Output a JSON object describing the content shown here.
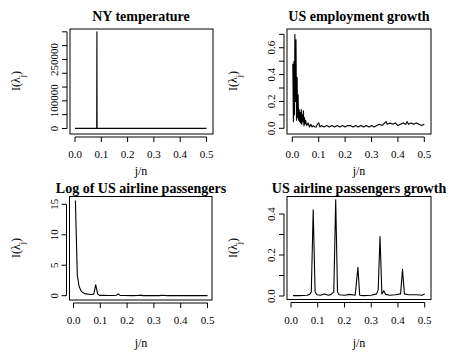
{
  "chart_data": [
    {
      "type": "line",
      "title": "NY temperature",
      "xlabel": "j/n",
      "ylabel": "I(λj)",
      "xlim": [
        0,
        0.5
      ],
      "ylim": [
        0,
        350000
      ],
      "xticks": [
        0.0,
        0.1,
        0.2,
        0.3,
        0.4,
        0.5
      ],
      "xtick_labels": [
        "0.0",
        "0.1",
        "0.2",
        "0.3",
        "0.4",
        "0.5"
      ],
      "yticks": [
        0,
        50000,
        100000,
        150000,
        200000,
        250000,
        300000,
        350000
      ],
      "ytick_labels": [
        "0",
        "",
        "100000",
        "",
        "",
        "250000",
        "",
        ""
      ],
      "grid": false,
      "series": [
        {
          "name": "periodogram",
          "x": [
            0.0,
            0.08,
            0.0825,
            0.0833,
            0.0842,
            0.086,
            0.5
          ],
          "y": [
            300,
            300,
            300,
            350000,
            300,
            300,
            300
          ]
        }
      ]
    },
    {
      "type": "line",
      "title": "US employment growth",
      "xlabel": "j/n",
      "ylabel": "I(λj)",
      "xlim": [
        0,
        0.5
      ],
      "ylim": [
        0,
        0.7
      ],
      "xticks": [
        0.0,
        0.1,
        0.2,
        0.3,
        0.4,
        0.5
      ],
      "xtick_labels": [
        "0.0",
        "0.1",
        "0.2",
        "0.3",
        "0.4",
        "0.5"
      ],
      "yticks": [
        0.0,
        0.1,
        0.2,
        0.3,
        0.4,
        0.5,
        0.6,
        0.7
      ],
      "ytick_labels": [
        "0.0",
        "",
        "0.2",
        "",
        "0.4",
        "",
        "0.6",
        ""
      ],
      "grid": false,
      "series": [
        {
          "name": "periodogram",
          "x": [
            0.002,
            0.004,
            0.006,
            0.008,
            0.01,
            0.012,
            0.014,
            0.016,
            0.018,
            0.02,
            0.022,
            0.024,
            0.026,
            0.028,
            0.03,
            0.032,
            0.034,
            0.036,
            0.038,
            0.04,
            0.042,
            0.044,
            0.046,
            0.048,
            0.05,
            0.055,
            0.06,
            0.065,
            0.07,
            0.075,
            0.08,
            0.085,
            0.09,
            0.095,
            0.1,
            0.105,
            0.11,
            0.12,
            0.13,
            0.14,
            0.15,
            0.16,
            0.17,
            0.18,
            0.19,
            0.2,
            0.21,
            0.22,
            0.23,
            0.24,
            0.25,
            0.26,
            0.27,
            0.28,
            0.29,
            0.3,
            0.31,
            0.32,
            0.33,
            0.34,
            0.35,
            0.355,
            0.36,
            0.37,
            0.38,
            0.39,
            0.4,
            0.41,
            0.42,
            0.43,
            0.435,
            0.44,
            0.45,
            0.46,
            0.47,
            0.48,
            0.49,
            0.5
          ],
          "y": [
            0.48,
            0.05,
            0.5,
            0.1,
            0.7,
            0.2,
            0.66,
            0.06,
            0.38,
            0.08,
            0.25,
            0.06,
            0.14,
            0.05,
            0.12,
            0.04,
            0.14,
            0.03,
            0.1,
            0.05,
            0.13,
            0.02,
            0.08,
            0.03,
            0.06,
            0.02,
            0.04,
            0.01,
            0.03,
            0.01,
            0.02,
            0.01,
            0.01,
            0.03,
            0.04,
            0.01,
            0.02,
            0.01,
            0.02,
            0.01,
            0.02,
            0.01,
            0.02,
            0.01,
            0.02,
            0.01,
            0.02,
            0.02,
            0.01,
            0.02,
            0.01,
            0.02,
            0.01,
            0.02,
            0.01,
            0.02,
            0.01,
            0.02,
            0.03,
            0.02,
            0.04,
            0.05,
            0.03,
            0.04,
            0.03,
            0.04,
            0.02,
            0.03,
            0.04,
            0.03,
            0.05,
            0.03,
            0.04,
            0.03,
            0.04,
            0.03,
            0.02,
            0.03
          ]
        }
      ]
    },
    {
      "type": "line",
      "title": "Log of US airline passengers",
      "xlabel": "j/n",
      "ylabel": "I(λj)",
      "xlim": [
        0,
        0.5
      ],
      "ylim": [
        0,
        15
      ],
      "xticks": [
        0.0,
        0.1,
        0.2,
        0.3,
        0.4,
        0.5
      ],
      "xtick_labels": [
        "0.0",
        "0.1",
        "0.2",
        "0.3",
        "0.4",
        "0.5"
      ],
      "yticks": [
        0,
        5,
        10,
        15
      ],
      "ytick_labels": [
        "0",
        "5",
        "10",
        "15"
      ],
      "grid": false,
      "series": [
        {
          "name": "periodogram",
          "x": [
            0.007,
            0.014,
            0.021,
            0.028,
            0.035,
            0.042,
            0.049,
            0.056,
            0.063,
            0.069,
            0.076,
            0.083,
            0.09,
            0.097,
            0.11,
            0.13,
            0.15,
            0.16,
            0.167,
            0.174,
            0.19,
            0.22,
            0.24,
            0.25,
            0.26,
            0.29,
            0.32,
            0.333,
            0.35,
            0.38,
            0.417,
            0.44,
            0.47,
            0.5
          ],
          "y": [
            15.6,
            3.4,
            1.5,
            0.8,
            0.5,
            0.35,
            0.3,
            0.25,
            0.2,
            0.2,
            0.3,
            1.8,
            0.3,
            0.05,
            0.05,
            0.03,
            0.04,
            0.08,
            0.3,
            0.05,
            0.03,
            0.02,
            0.03,
            0.1,
            0.02,
            0.02,
            0.02,
            0.06,
            0.02,
            0.02,
            0.04,
            0.02,
            0.02,
            0.02
          ]
        }
      ]
    },
    {
      "type": "line",
      "title": "US airline passengers growth",
      "xlabel": "j/n",
      "ylabel": "I(λj)",
      "xlim": [
        0,
        0.5
      ],
      "ylim": [
        0,
        0.47
      ],
      "xticks": [
        0.0,
        0.1,
        0.2,
        0.3,
        0.4,
        0.5
      ],
      "xtick_labels": [
        "0.0",
        "0.1",
        "0.2",
        "0.3",
        "0.4",
        "0.5"
      ],
      "yticks": [
        0.0,
        0.1,
        0.2,
        0.3,
        0.4
      ],
      "ytick_labels": [
        "0.0",
        "",
        "0.2",
        "",
        "0.4"
      ],
      "grid": false,
      "series": [
        {
          "name": "periodogram",
          "x": [
            0.007,
            0.03,
            0.06,
            0.07,
            0.076,
            0.083,
            0.09,
            0.097,
            0.11,
            0.125,
            0.14,
            0.15,
            0.16,
            0.167,
            0.174,
            0.18,
            0.2,
            0.22,
            0.24,
            0.25,
            0.257,
            0.27,
            0.3,
            0.32,
            0.326,
            0.333,
            0.34,
            0.347,
            0.354,
            0.37,
            0.39,
            0.41,
            0.417,
            0.424,
            0.44,
            0.47,
            0.49,
            0.5
          ],
          "y": [
            0.002,
            0.002,
            0.004,
            0.008,
            0.02,
            0.42,
            0.02,
            0.006,
            0.004,
            0.01,
            0.004,
            0.008,
            0.02,
            0.47,
            0.02,
            0.006,
            0.004,
            0.008,
            0.004,
            0.14,
            0.004,
            0.002,
            0.004,
            0.01,
            0.03,
            0.29,
            0.01,
            0.025,
            0.008,
            0.004,
            0.006,
            0.01,
            0.13,
            0.01,
            0.006,
            0.006,
            0.004,
            0.01
          ]
        }
      ]
    }
  ],
  "panels": [
    {
      "title": "NY temperature",
      "xlabel": "j/n",
      "ylabel_main": "I(λ",
      "ylabel_sub": "j",
      "ylabel_close": ")"
    },
    {
      "title": "US employment growth",
      "xlabel": "j/n",
      "ylabel_main": "I(λ",
      "ylabel_sub": "j",
      "ylabel_close": ")"
    },
    {
      "title": "Log of US airline passengers",
      "xlabel": "j/n",
      "ylabel_main": "I(λ",
      "ylabel_sub": "j",
      "ylabel_close": ")"
    },
    {
      "title": "US airline passengers growth",
      "xlabel": "j/n",
      "ylabel_main": "I(λ",
      "ylabel_sub": "j",
      "ylabel_close": ")"
    }
  ]
}
